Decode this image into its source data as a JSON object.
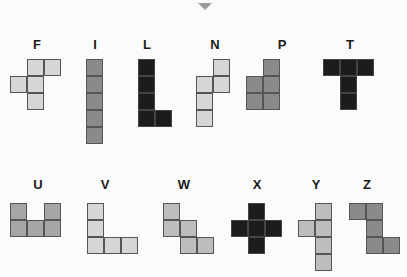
{
  "title_caret": "down-caret",
  "cell_size": 17,
  "colors": {
    "light": "#d6d6d6",
    "medium": "#bdbdbd",
    "mid": "#a6a6a6",
    "dark": "#8a8a8a",
    "black": "#1c1c1c"
  },
  "pieces": [
    {
      "name": "F",
      "label_x": 37,
      "label_y": 38,
      "color": "light",
      "cells": [
        [
          27,
          59
        ],
        [
          44,
          59
        ],
        [
          10,
          76
        ],
        [
          27,
          76
        ],
        [
          27,
          93
        ]
      ]
    },
    {
      "name": "I",
      "label_x": 95,
      "label_y": 38,
      "color": "dark",
      "cells": [
        [
          86,
          59
        ],
        [
          86,
          76
        ],
        [
          86,
          93
        ],
        [
          86,
          110
        ],
        [
          86,
          127
        ]
      ]
    },
    {
      "name": "L",
      "label_x": 147,
      "label_y": 38,
      "color": "black",
      "cells": [
        [
          138,
          59
        ],
        [
          138,
          76
        ],
        [
          138,
          93
        ],
        [
          138,
          110
        ],
        [
          155,
          110
        ]
      ]
    },
    {
      "name": "N",
      "label_x": 215,
      "label_y": 38,
      "color": "light",
      "cells": [
        [
          213,
          59
        ],
        [
          213,
          76
        ],
        [
          196,
          76
        ],
        [
          196,
          93
        ],
        [
          196,
          110
        ]
      ]
    },
    {
      "name": "P",
      "label_x": 282,
      "label_y": 38,
      "color": "dark",
      "cells": [
        [
          263,
          59
        ],
        [
          246,
          76
        ],
        [
          263,
          76
        ],
        [
          246,
          93
        ],
        [
          263,
          93
        ]
      ]
    },
    {
      "name": "T",
      "label_x": 350,
      "label_y": 38,
      "color": "black",
      "cells": [
        [
          323,
          59
        ],
        [
          340,
          59
        ],
        [
          357,
          59
        ],
        [
          340,
          76
        ],
        [
          340,
          93
        ]
      ]
    },
    {
      "name": "U",
      "label_x": 38,
      "label_y": 178,
      "color": "mid",
      "cells": [
        [
          10,
          203
        ],
        [
          44,
          203
        ],
        [
          10,
          220
        ],
        [
          27,
          220
        ],
        [
          44,
          220
        ]
      ]
    },
    {
      "name": "V",
      "label_x": 105,
      "label_y": 178,
      "color": "light",
      "cells": [
        [
          87,
          203
        ],
        [
          87,
          220
        ],
        [
          87,
          237
        ],
        [
          104,
          237
        ],
        [
          121,
          237
        ]
      ]
    },
    {
      "name": "W",
      "label_x": 184,
      "label_y": 178,
      "color": "medium",
      "cells": [
        [
          163,
          203
        ],
        [
          163,
          220
        ],
        [
          180,
          220
        ],
        [
          180,
          237
        ],
        [
          197,
          237
        ]
      ]
    },
    {
      "name": "X",
      "label_x": 257,
      "label_y": 178,
      "color": "black",
      "cells": [
        [
          248,
          203
        ],
        [
          231,
          220
        ],
        [
          248,
          220
        ],
        [
          265,
          220
        ],
        [
          248,
          237
        ]
      ]
    },
    {
      "name": "Y",
      "label_x": 316,
      "label_y": 178,
      "color": "medium",
      "cells": [
        [
          315,
          203
        ],
        [
          298,
          220
        ],
        [
          315,
          220
        ],
        [
          315,
          237
        ],
        [
          315,
          254
        ]
      ]
    },
    {
      "name": "Z",
      "label_x": 367,
      "label_y": 178,
      "color": "dark",
      "cells": [
        [
          349,
          203
        ],
        [
          366,
          203
        ],
        [
          366,
          220
        ],
        [
          366,
          237
        ],
        [
          383,
          237
        ]
      ]
    }
  ]
}
